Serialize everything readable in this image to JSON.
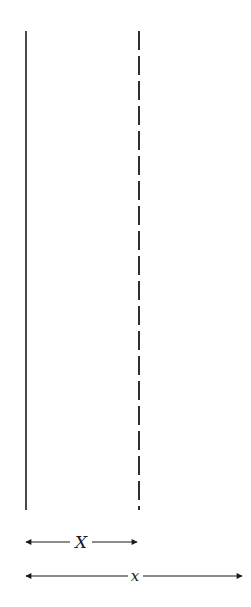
{
  "diagram": {
    "colors": {
      "line": "#1a1a1a",
      "background": "#ffffff"
    },
    "solid_line": {
      "x": 26,
      "y1": 31,
      "y2": 510
    },
    "dashed_line": {
      "x": 139,
      "y1": 31,
      "y2": 510,
      "dash": "19 6"
    },
    "arrows": [
      {
        "label": "X",
        "y": 542,
        "x1": 25,
        "x2": 137,
        "label_x": 80
      },
      {
        "label": "x",
        "y": 576,
        "x1": 25,
        "x2": 242,
        "label_x": 135
      }
    ]
  }
}
